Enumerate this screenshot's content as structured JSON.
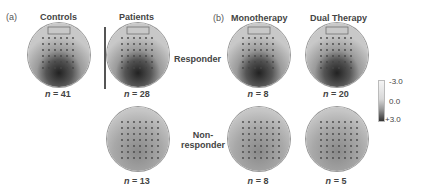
{
  "panels": {
    "a": {
      "label": "(a)",
      "columns": [
        "Controls",
        "Patients"
      ]
    },
    "b": {
      "label": "(b)",
      "columns": [
        "Monotherapy",
        "Dual Therapy"
      ]
    }
  },
  "rows": {
    "responder": "Responder",
    "nonresponder_line1": "Non-",
    "nonresponder_line2": "responder"
  },
  "counts": {
    "controls": "= 41",
    "patients_responder": "= 28",
    "patients_nonresponder": "= 13",
    "mono_responder": "= 8",
    "dual_responder": "= 20",
    "mono_nonresponder": "= 8",
    "dual_nonresponder": "= 5"
  },
  "n_symbol": "n",
  "colorbar": {
    "top": "-3.0",
    "mid": "0.0",
    "bottom": "+3.0"
  }
}
